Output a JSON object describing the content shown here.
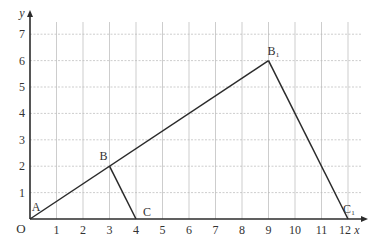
{
  "diagram": {
    "type": "coordinate-geometry",
    "axes": {
      "x_label": "x",
      "y_label": "y",
      "origin_label": "O",
      "x_ticks": [
        "1",
        "2",
        "3",
        "4",
        "5",
        "6",
        "7",
        "8",
        "9",
        "10",
        "11",
        "12"
      ],
      "y_ticks": [
        "1",
        "2",
        "3",
        "4",
        "5",
        "6",
        "7"
      ],
      "xlim": [
        0,
        12.5
      ],
      "ylim": [
        0,
        7.5
      ],
      "grid": "dashed"
    },
    "points": [
      {
        "label": "A",
        "x": 0,
        "y": 0
      },
      {
        "label": "B",
        "x": 3,
        "y": 2
      },
      {
        "label": "C",
        "x": 4,
        "y": 0
      },
      {
        "label": "B₁",
        "x": 9,
        "y": 6
      },
      {
        "label": "C₁",
        "x": 12,
        "y": 0
      }
    ],
    "segments": [
      [
        "A",
        "B₁"
      ],
      [
        "B",
        "C"
      ],
      [
        "B₁",
        "C₁"
      ],
      [
        "A",
        "C₁"
      ]
    ],
    "colors": {
      "line": "#2b2b2b",
      "grid": "#b8b8b8",
      "text": "#333333"
    }
  }
}
